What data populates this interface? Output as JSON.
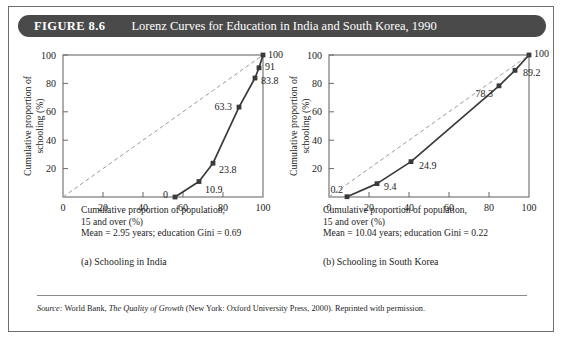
{
  "figure": {
    "number": "FIGURE 8.6",
    "title": "Lorenz Curves for Education in India and South Korea, 1990",
    "header_bg": "#4a4a4a",
    "header_text_color": "#ffffff"
  },
  "source": {
    "label": "Source:",
    "text_before_italic": " World Bank, ",
    "italic_title": "The Quality of Growth",
    "text_after_italic": " (New York: Oxford University Press, 2000). Reprinted with permission."
  },
  "panels": [
    {
      "key": "india",
      "subcaption": "(a) Schooling in India",
      "axis_caption_line1": "Cumulative proportion of population,",
      "axis_caption_line2": "15 and over (%)",
      "axis_caption_line3": "Mean = 2.95 years; education Gini = 0.69",
      "mean_years": "2.95",
      "education_gini": "0.69"
    },
    {
      "key": "south_korea",
      "subcaption": "(b) Schooling in South Korea",
      "axis_caption_line1": "Cumulative proportion of population,",
      "axis_caption_line2": "15 and over (%)",
      "axis_caption_line3": "Mean = 10.04 years; education Gini = 0.22",
      "mean_years": "10.04",
      "education_gini": "0.22"
    }
  ],
  "chart_data": [
    {
      "type": "line",
      "title": "(a) Schooling in India",
      "xlabel": "Cumulative proportion of population, 15 and over (%)",
      "ylabel": "Cumulative proportion of schooling (%)",
      "xlim": [
        0,
        100
      ],
      "ylim": [
        0,
        100
      ],
      "xticks": [
        0,
        20,
        40,
        60,
        80,
        100
      ],
      "yticks": [
        0,
        20,
        40,
        60,
        80,
        100
      ],
      "xtick_labels": [
        "0",
        "20",
        "40",
        "60",
        "80",
        "100"
      ],
      "ytick_labels": [
        "",
        "20",
        "40",
        "60",
        "80",
        "100"
      ],
      "grid": false,
      "legend": "none",
      "series": [
        {
          "name": "Lorenz curve (India)",
          "style": "solid",
          "marker": "square",
          "x": [
            56,
            68,
            75,
            88,
            96,
            98,
            100
          ],
          "y": [
            0,
            10.9,
            23.8,
            63.3,
            83.8,
            91,
            100
          ],
          "point_labels": [
            "0",
            "10.9",
            "23.8",
            "63.3",
            "83.8",
            "91",
            "100"
          ]
        },
        {
          "name": "Line of equality",
          "style": "dashed",
          "marker": "none",
          "x": [
            0,
            100
          ],
          "y": [
            0,
            100
          ],
          "point_labels": []
        }
      ],
      "annotations": [
        {
          "text": "Mean = 2.95 years; education Gini = 0.69"
        }
      ]
    },
    {
      "type": "line",
      "title": "(b) Schooling in South Korea",
      "xlabel": "Cumulative proportion of population, 15 and over (%)",
      "ylabel": "Cumulative proportion of schooling (%)",
      "xlim": [
        0,
        100
      ],
      "ylim": [
        0,
        100
      ],
      "xticks": [
        0,
        20,
        40,
        60,
        80,
        100
      ],
      "yticks": [
        0,
        20,
        40,
        60,
        80,
        100
      ],
      "xtick_labels": [
        "0",
        "20",
        "40",
        "60",
        "80",
        "100"
      ],
      "ytick_labels": [
        "",
        "20",
        "40",
        "60",
        "80",
        "100"
      ],
      "grid": false,
      "legend": "none",
      "series": [
        {
          "name": "Lorenz curve (South Korea)",
          "style": "solid",
          "marker": "square",
          "x": [
            9,
            24,
            41,
            85,
            93,
            100
          ],
          "y": [
            0.2,
            9.4,
            24.9,
            78.3,
            89.2,
            100
          ],
          "point_labels": [
            "0.2",
            "9.4",
            "24.9",
            "78.3",
            "89.2",
            "100"
          ]
        },
        {
          "name": "Line of equality",
          "style": "dashed",
          "marker": "none",
          "x": [
            0,
            100
          ],
          "y": [
            0,
            100
          ],
          "point_labels": []
        }
      ],
      "annotations": [
        {
          "text": "Mean = 10.04 years; education Gini = 0.22"
        }
      ]
    }
  ],
  "style": {
    "curve_color": "#3a3a3a",
    "diagonal_color": "#9a9aa5",
    "axis_color": "#6b6b6b",
    "text_color": "#1c1c1c"
  }
}
